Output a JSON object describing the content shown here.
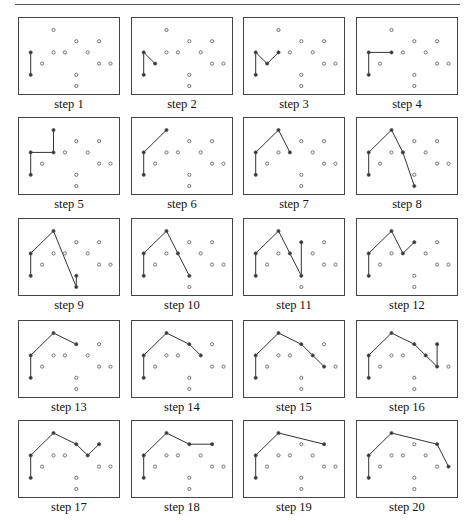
{
  "figure": {
    "title": "",
    "points": {
      "A": [
        3,
        0
      ],
      "B": [
        5,
        1
      ],
      "C": [
        7,
        1
      ],
      "D": [
        1,
        2
      ],
      "E": [
        3,
        2
      ],
      "F": [
        4,
        2
      ],
      "G": [
        6,
        2
      ],
      "H": [
        2,
        3
      ],
      "I": [
        7,
        3
      ],
      "J": [
        8,
        3
      ],
      "K": [
        1,
        4
      ],
      "L": [
        5,
        4
      ],
      "M": [
        5,
        5
      ]
    },
    "steps": [
      {
        "label": "step 1",
        "path": [
          "K",
          "D"
        ]
      },
      {
        "label": "step 2",
        "path": [
          "K",
          "D",
          "H"
        ]
      },
      {
        "label": "step 3",
        "path": [
          "K",
          "D",
          "H",
          "E"
        ]
      },
      {
        "label": "step 4",
        "path": [
          "K",
          "D",
          "E"
        ]
      },
      {
        "label": "step 5",
        "path": [
          "K",
          "D",
          "E",
          "A"
        ]
      },
      {
        "label": "step 6",
        "path": [
          "K",
          "D",
          "A"
        ]
      },
      {
        "label": "step 7",
        "path": [
          "K",
          "D",
          "A",
          "F"
        ]
      },
      {
        "label": "step 8",
        "path": [
          "K",
          "D",
          "A",
          "F",
          "M"
        ]
      },
      {
        "label": "step 9",
        "path": [
          "K",
          "D",
          "A",
          "M",
          "L"
        ]
      },
      {
        "label": "step 10",
        "path": [
          "K",
          "D",
          "A",
          "F",
          "L"
        ]
      },
      {
        "label": "step 11",
        "path": [
          "K",
          "D",
          "A",
          "F",
          "L",
          "B"
        ]
      },
      {
        "label": "step 12",
        "path": [
          "K",
          "D",
          "A",
          "F",
          "B"
        ]
      },
      {
        "label": "step 13",
        "path": [
          "K",
          "D",
          "A",
          "B"
        ]
      },
      {
        "label": "step 14",
        "path": [
          "K",
          "D",
          "A",
          "B",
          "G"
        ]
      },
      {
        "label": "step 15",
        "path": [
          "K",
          "D",
          "A",
          "B",
          "G",
          "I"
        ]
      },
      {
        "label": "step 16",
        "path": [
          "K",
          "D",
          "A",
          "B",
          "G",
          "I",
          "C"
        ]
      },
      {
        "label": "step 17",
        "path": [
          "K",
          "D",
          "A",
          "B",
          "G",
          "C"
        ]
      },
      {
        "label": "step 18",
        "path": [
          "K",
          "D",
          "A",
          "B",
          "C"
        ]
      },
      {
        "label": "step 19",
        "path": [
          "K",
          "D",
          "A",
          "C"
        ]
      },
      {
        "label": "step 20",
        "path": [
          "K",
          "D",
          "A",
          "C",
          "J"
        ]
      }
    ],
    "colors": {
      "line": "#333333",
      "point": "#555555",
      "border": "#444444"
    }
  }
}
